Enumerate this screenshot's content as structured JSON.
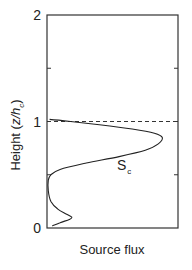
{
  "chart_data": {
    "type": "line",
    "title": "",
    "xlabel": "Source flux",
    "ylabel": "Height (z/h_c)",
    "ylabel_parts": {
      "main": "Height (",
      "var": "z/h",
      "sub": "c",
      "close": ")"
    },
    "ylim": [
      0,
      2
    ],
    "xlim": [
      0,
      1
    ],
    "y_ticks": [
      0,
      0.5,
      1,
      1.5,
      2
    ],
    "y_tick_labels": [
      "0",
      "",
      "1",
      "",
      "2"
    ],
    "x_ticks": [],
    "grid": false,
    "legend": null,
    "reference_line": {
      "y": 1.0,
      "style": "dashed",
      "label": "canopy height"
    },
    "series": [
      {
        "name": "S_c",
        "label_main": "S",
        "label_sub": "c",
        "points": [
          [
            0.04,
            0.02
          ],
          [
            0.1,
            0.05
          ],
          [
            0.17,
            0.08
          ],
          [
            0.19,
            0.1
          ],
          [
            0.15,
            0.13
          ],
          [
            0.08,
            0.18
          ],
          [
            0.03,
            0.25
          ],
          [
            0.01,
            0.35
          ],
          [
            0.01,
            0.45
          ],
          [
            0.03,
            0.5
          ],
          [
            0.1,
            0.55
          ],
          [
            0.3,
            0.61
          ],
          [
            0.55,
            0.67
          ],
          [
            0.75,
            0.73
          ],
          [
            0.85,
            0.79
          ],
          [
            0.88,
            0.85
          ],
          [
            0.82,
            0.89
          ],
          [
            0.65,
            0.93
          ],
          [
            0.4,
            0.97
          ],
          [
            0.18,
            1.0
          ],
          [
            0.02,
            1.02
          ]
        ]
      }
    ],
    "annotations": [
      {
        "text": "S_c",
        "x": 0.55,
        "y": 0.58
      }
    ]
  }
}
